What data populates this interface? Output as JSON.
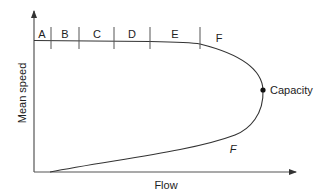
{
  "diagram": {
    "type": "speed-flow curve",
    "x_axis": {
      "label": "Flow"
    },
    "y_axis": {
      "label": "Mean speed"
    },
    "level_of_service": {
      "labels": [
        "A",
        "B",
        "C",
        "D",
        "E",
        "F"
      ]
    },
    "capacity_point": {
      "label": "Capacity"
    },
    "lower_branch_label": "F",
    "colors": {
      "line": "#333333",
      "axis": "#555555",
      "text": "#222222",
      "background": "#ffffff"
    }
  }
}
